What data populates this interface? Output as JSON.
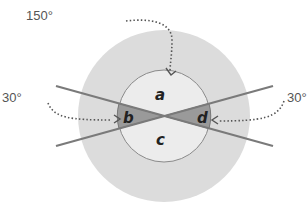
{
  "angles": {
    "top": "150°",
    "left": "30°",
    "right": "30°"
  },
  "regions": {
    "a": "a",
    "b": "b",
    "c": "c",
    "d": "d"
  },
  "colors": {
    "outer_circle": "#dcdcdc",
    "inner_circle": "#ececec",
    "shaded_wedges": "#9a9a9a",
    "lines": "#7a7a7a",
    "arrows": "#555555"
  }
}
